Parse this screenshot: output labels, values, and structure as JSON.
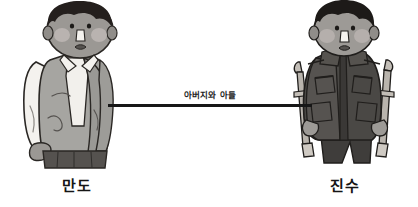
{
  "diagram": {
    "type": "relationship-diagram",
    "background_color": "#ffffff",
    "width": 418,
    "height": 207
  },
  "relationship": {
    "label": "아버지와 아들",
    "line_color": "#171717",
    "from": "만도",
    "to": "진수"
  },
  "characters": [
    {
      "id": "mando",
      "name": "만도",
      "position": "left",
      "description": "standing man in gray vest over white shirt",
      "colors": {
        "hair": "#241f1d",
        "skin": "#9b9894",
        "cheek": "#b7b1ae",
        "vest": "#a6a5a1",
        "shirt": "#f2f0ec",
        "trousers": "#55524f",
        "outline": "#2a2724"
      }
    },
    {
      "id": "jinsu",
      "name": "진수",
      "position": "right",
      "description": "stooping man in dark military jacket using two crutches",
      "colors": {
        "hair": "#1d1a18",
        "skin": "#9d9a96",
        "cheek": "#b5afac",
        "jacket": "#4a4845",
        "jacket_dark": "#3a3836",
        "trousers": "#3f3d3b",
        "crutch": "#b9b4ad",
        "outline": "#201e1c"
      }
    }
  ]
}
